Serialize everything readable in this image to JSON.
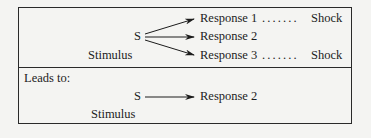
{
  "top_panel": {
    "stimulus_symbol": "S",
    "stimulus_label": "Stimulus",
    "responses": [
      {
        "label": "Response 1",
        "leader": ". . . . . . .",
        "outcome": "Shock"
      },
      {
        "label": "Response 2",
        "leader": "",
        "outcome": ""
      },
      {
        "label": "Response 3",
        "leader": ". . . . . . .",
        "outcome": "Shock"
      }
    ]
  },
  "bottom_panel": {
    "heading": "Leads to:",
    "stimulus_symbol": "S",
    "stimulus_label": "Stimulus",
    "response": "Response 2"
  },
  "colors": {
    "ink": "#1c1c1c",
    "background": "#f4f4f2"
  }
}
